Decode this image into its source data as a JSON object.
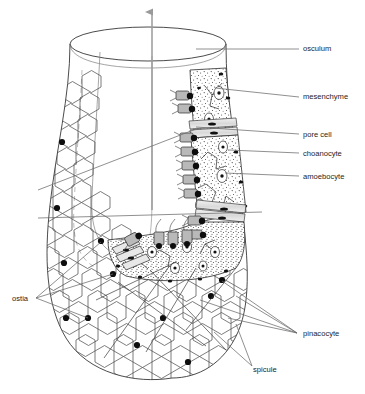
{
  "figure": {
    "caption": "",
    "background_color": "#ffffff",
    "ink_color": "#1d1d1d",
    "leader_color": "#6e6e6e",
    "arrow_color": "#9a9a9a"
  },
  "labels": [
    {
      "id": "osculum",
      "text": "osculum",
      "x": 303,
      "y": 49,
      "anchor": "start",
      "leader": [
        [
          262,
          49
        ],
        [
          299,
          49
        ]
      ]
    },
    {
      "id": "mesenchyme",
      "text": "mesenchyme",
      "x": 303,
      "y": 97,
      "anchor": "start",
      "leader": [
        [
          218,
          86
        ],
        [
          299,
          97
        ]
      ]
    },
    {
      "id": "pore-cell",
      "text": "pore cell",
      "x": 303,
      "y": 135,
      "anchor": "start",
      "leader": [
        [
          205,
          127
        ],
        [
          299,
          135
        ]
      ]
    },
    {
      "id": "choanocyte",
      "text": "choanocyte",
      "x": 303,
      "y": 154,
      "anchor": "start",
      "leader": [
        [
          227,
          150
        ],
        [
          299,
          154
        ]
      ]
    },
    {
      "id": "amoebocyte",
      "text": "amoebocyte",
      "x": 303,
      "y": 177,
      "anchor": "start",
      "leader": [
        [
          224,
          172
        ],
        [
          299,
          177
        ]
      ]
    },
    {
      "id": "ostia",
      "text": "ostia",
      "x": 12,
      "y": 299,
      "anchor": "start",
      "anchor_point": [
        34,
        299
      ]
    },
    {
      "id": "pinacocyte",
      "text": "pinacocyte",
      "x": 303,
      "y": 334,
      "anchor": "start",
      "anchor_point": [
        299,
        334
      ]
    },
    {
      "id": "spicule",
      "text": "spicule",
      "x": 253,
      "y": 370,
      "anchor": "start",
      "anchor_point": [
        250,
        368
      ]
    }
  ],
  "icons": {
    "flow_arrow": "up-arrow-icon",
    "osculum_opening": "ellipse-icon"
  },
  "anatomy": {
    "structures": [
      "osculum",
      "spongocoel",
      "mesenchyme",
      "pore cell",
      "choanocyte",
      "amoebocyte",
      "pinacocyte",
      "spicule",
      "ostia"
    ],
    "water_flow_direction": "upward out of osculum"
  }
}
